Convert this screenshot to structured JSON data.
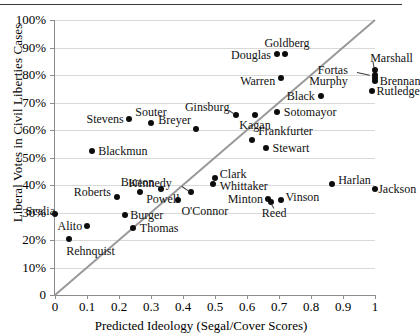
{
  "chart_data": {
    "type": "scatter",
    "title": "",
    "xlabel": "Predicted Ideology (Segal/Cover Scores)",
    "ylabel": "Liberal Votes in Civil Liberties Cases",
    "xlim": [
      0,
      1
    ],
    "ylim": [
      0,
      1
    ],
    "xticks": [
      "0",
      "0.1",
      "0.2",
      "0.3",
      "0.4",
      "0.5",
      "0.6",
      "0.7",
      "0.8",
      "0.9",
      "1"
    ],
    "yticks": [
      "0",
      "10%",
      "20%",
      "30%",
      "40%",
      "50%",
      "60%",
      "70%",
      "80%",
      "90%",
      "100%"
    ],
    "grid": "horizontal",
    "legend": "none",
    "reference_line": {
      "name": "forty-five-degree-line",
      "from": [
        0,
        0
      ],
      "to": [
        1,
        1
      ],
      "color": "#999999"
    },
    "point_color": "#0d0d0d",
    "points": [
      {
        "label": "Scalia",
        "x": 0.0,
        "y": 0.295,
        "lx": 0.0,
        "ly": 0.305,
        "anchor": "r"
      },
      {
        "label": "Alito",
        "x": 0.1,
        "y": 0.25,
        "lx": 0.085,
        "ly": 0.25,
        "anchor": "r"
      },
      {
        "label": "Rehnquist",
        "x": 0.045,
        "y": 0.205,
        "lx": 0.035,
        "ly": 0.16,
        "anchor": "l"
      },
      {
        "label": "Blackmun",
        "x": 0.115,
        "y": 0.525,
        "lx": 0.135,
        "ly": 0.525,
        "anchor": "l"
      },
      {
        "label": "Roberts",
        "x": 0.195,
        "y": 0.355,
        "lx": 0.175,
        "ly": 0.375,
        "anchor": "r"
      },
      {
        "label": "Burger",
        "x": 0.22,
        "y": 0.29,
        "lx": 0.235,
        "ly": 0.29,
        "anchor": "l"
      },
      {
        "label": "Thomas",
        "x": 0.245,
        "y": 0.245,
        "lx": 0.265,
        "ly": 0.245,
        "anchor": "l"
      },
      {
        "label": "Powell",
        "x": 0.265,
        "y": 0.375,
        "lx": 0.285,
        "ly": 0.35,
        "anchor": "l"
      },
      {
        "label": "Burton",
        "x": 0.33,
        "y": 0.385,
        "lx": 0.31,
        "ly": 0.412,
        "anchor": "r"
      },
      {
        "label": "Stevens",
        "x": 0.23,
        "y": 0.64,
        "lx": 0.215,
        "ly": 0.64,
        "anchor": "r"
      },
      {
        "label": "Souter",
        "x": 0.3,
        "y": 0.625,
        "lx": 0.3,
        "ly": 0.665,
        "anchor": "c"
      },
      {
        "label": "Kennedy",
        "x": 0.425,
        "y": 0.375,
        "lx": 0.365,
        "ly": 0.408,
        "anchor": "r"
      },
      {
        "label": "O'Connor",
        "x": 0.385,
        "y": 0.345,
        "lx": 0.395,
        "ly": 0.305,
        "anchor": "l"
      },
      {
        "label": "Clark",
        "x": 0.5,
        "y": 0.425,
        "lx": 0.515,
        "ly": 0.44,
        "anchor": "l"
      },
      {
        "label": "Whittaker",
        "x": 0.495,
        "y": 0.405,
        "lx": 0.515,
        "ly": 0.395,
        "anchor": "l"
      },
      {
        "label": "Breyer",
        "x": 0.44,
        "y": 0.605,
        "lx": 0.425,
        "ly": 0.638,
        "anchor": "r"
      },
      {
        "label": "Ginsburg",
        "x": 0.565,
        "y": 0.655,
        "lx": 0.545,
        "ly": 0.685,
        "anchor": "r"
      },
      {
        "label": "Kagan",
        "x": 0.625,
        "y": 0.655,
        "lx": 0.625,
        "ly": 0.618,
        "anchor": "c"
      },
      {
        "label": "Sotomayor",
        "x": 0.695,
        "y": 0.665,
        "lx": 0.715,
        "ly": 0.665,
        "anchor": "l"
      },
      {
        "label": "Frankfurter",
        "x": 0.615,
        "y": 0.565,
        "lx": 0.635,
        "ly": 0.598,
        "anchor": "l"
      },
      {
        "label": "Stewart",
        "x": 0.66,
        "y": 0.535,
        "lx": 0.68,
        "ly": 0.535,
        "anchor": "l"
      },
      {
        "label": "Minton",
        "x": 0.665,
        "y": 0.35,
        "lx": 0.65,
        "ly": 0.35,
        "anchor": "r"
      },
      {
        "label": "Reed",
        "x": 0.675,
        "y": 0.338,
        "lx": 0.685,
        "ly": 0.3,
        "anchor": "c"
      },
      {
        "label": "Vinson",
        "x": 0.705,
        "y": 0.345,
        "lx": 0.72,
        "ly": 0.355,
        "anchor": "l"
      },
      {
        "label": "Harlan",
        "x": 0.865,
        "y": 0.405,
        "lx": 0.885,
        "ly": 0.42,
        "anchor": "l"
      },
      {
        "label": "Jackson",
        "x": 1.0,
        "y": 0.385,
        "lx": 1.01,
        "ly": 0.385,
        "anchor": "l"
      },
      {
        "label": "Warren",
        "x": 0.705,
        "y": 0.79,
        "lx": 0.688,
        "ly": 0.78,
        "anchor": "r"
      },
      {
        "label": "Black",
        "x": 0.83,
        "y": 0.725,
        "lx": 0.812,
        "ly": 0.725,
        "anchor": "r"
      },
      {
        "label": "Douglas",
        "x": 0.695,
        "y": 0.875,
        "lx": 0.675,
        "ly": 0.872,
        "anchor": "r"
      },
      {
        "label": "Goldberg",
        "x": 0.72,
        "y": 0.878,
        "lx": 0.725,
        "ly": 0.918,
        "anchor": "c"
      },
      {
        "label": "Fortas",
        "x": 1.0,
        "y": 0.8,
        "lx": 0.915,
        "ly": 0.818,
        "anchor": "r"
      },
      {
        "label": "Murphy",
        "x": 1.0,
        "y": 0.78,
        "lx": 0.915,
        "ly": 0.778,
        "anchor": "r"
      },
      {
        "label": "Marshall",
        "x": 1.0,
        "y": 0.818,
        "lx": 0.985,
        "ly": 0.862,
        "anchor": "l"
      },
      {
        "label": "Brennan",
        "x": 1.0,
        "y": 0.79,
        "lx": 1.015,
        "ly": 0.778,
        "anchor": "l"
      },
      {
        "label": "Rutledge",
        "x": 0.99,
        "y": 0.742,
        "lx": 1.005,
        "ly": 0.742,
        "anchor": "l"
      }
    ],
    "leaders": [
      {
        "name": "ginsburg-leader",
        "x1": 0.545,
        "y1": 0.672,
        "x2": 0.56,
        "y2": 0.66
      },
      {
        "name": "kennedy-leader",
        "x1": 0.398,
        "y1": 0.398,
        "x2": 0.42,
        "y2": 0.38
      },
      {
        "name": "fortas-leader",
        "x1": 0.945,
        "y1": 0.81,
        "x2": 0.985,
        "y2": 0.8
      },
      {
        "name": "marshall-leader",
        "x1": 0.995,
        "y1": 0.85,
        "x2": 0.998,
        "y2": 0.828
      },
      {
        "name": "reed-leader",
        "x1": 0.684,
        "y1": 0.315,
        "x2": 0.676,
        "y2": 0.33
      }
    ]
  }
}
